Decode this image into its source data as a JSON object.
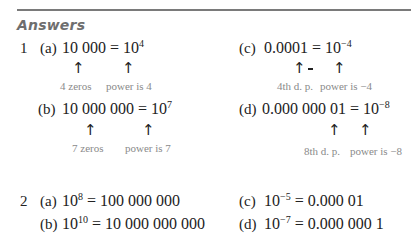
{
  "heading": "Answers",
  "q1": {
    "number": "1",
    "a": {
      "label": "(a)",
      "lhs": "10 000 = 10",
      "exp": "4",
      "note_left": "4 zeros",
      "note_right": "power is 4"
    },
    "b": {
      "label": "(b)",
      "lhs": "10 000 000 = 10",
      "exp": "7",
      "note_left": "7 zeros",
      "note_right": "power is 7"
    },
    "c": {
      "label": "(c)",
      "lhs": "0.0001 = 10",
      "exp": "−4",
      "note_left": "4th d. p.",
      "note_right": "power is −4"
    },
    "d": {
      "label": "(d)",
      "lhs": "0.000 000 01 = 10",
      "exp": "−8",
      "note_left": "8th d. p.",
      "note_right": "power is −8"
    }
  },
  "q2": {
    "number": "2",
    "a": {
      "label": "(a)",
      "base": "10",
      "exp": "8",
      "rhs": " = 100 000 000"
    },
    "b": {
      "label": "(b)",
      "base": "10",
      "exp": "10",
      "rhs": " = 10 000 000 000"
    },
    "c": {
      "label": "(c)",
      "base": "10",
      "exp": "−5",
      "rhs": " = 0.000 01"
    },
    "d": {
      "label": "(d)",
      "base": "10",
      "exp": "−7",
      "rhs": " = 0.000 000 1"
    }
  },
  "arrow_glyph": "↑"
}
